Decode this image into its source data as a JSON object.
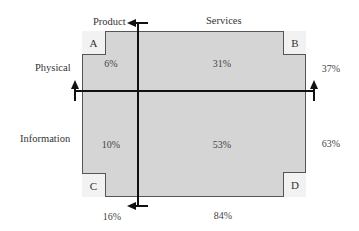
{
  "diagram": {
    "column_headers": {
      "product": "Product",
      "services": "Services"
    },
    "row_headers": {
      "physical": "Physical",
      "information": "Information"
    },
    "quadrants": {
      "physical_product": {
        "corner": "A",
        "value": "6%"
      },
      "physical_services": {
        "corner": "B",
        "value": "31%"
      },
      "information_product": {
        "corner": "C",
        "value": "10%"
      },
      "information_services": {
        "corner": "D",
        "value": "53%"
      }
    },
    "row_totals": {
      "physical": "37%",
      "information": "63%"
    },
    "column_totals": {
      "product": "16%",
      "services": "84%"
    },
    "colors": {
      "fill": "#d5d5d5",
      "corner_fill": "#f2f2f2",
      "line": "#111111",
      "border": "#555555"
    }
  }
}
